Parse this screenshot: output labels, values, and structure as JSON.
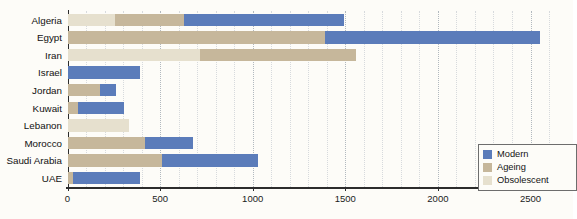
{
  "chart_data": {
    "type": "bar",
    "orientation": "horizontal",
    "stacked": true,
    "title": "",
    "subtitle": "",
    "xlabel": "",
    "ylabel": "",
    "xlim": [
      0,
      2600
    ],
    "xticks": [
      0,
      500,
      1000,
      1500,
      2000,
      2500
    ],
    "xticklabels": [
      "0",
      "500",
      "1000",
      "1500",
      "2000",
      "2500"
    ],
    "grid": true,
    "grid_axis": "x",
    "legend_position": "bottom-right",
    "categories": [
      "Algeria",
      "Egypt",
      "Iran",
      "Israel",
      "Jordan",
      "Kuwait",
      "Lebanon",
      "Morocco",
      "Saudi Arabia",
      "UAE"
    ],
    "series": [
      {
        "name": "Modern",
        "color": "#5b7cba",
        "values": [
          865,
          1160,
          0,
          390,
          85,
          250,
          0,
          255,
          520,
          360
        ]
      },
      {
        "name": "Ageing",
        "color": "#c6b79b",
        "values": [
          375,
          1390,
          845,
          0,
          175,
          55,
          0,
          420,
          510,
          30
        ]
      },
      {
        "name": "Obsolescent",
        "color": "#e6e0ce",
        "values": [
          255,
          0,
          715,
          0,
          0,
          0,
          330,
          0,
          0,
          0
        ]
      }
    ],
    "stack_order": [
      "Obsolescent",
      "Ageing",
      "Modern"
    ],
    "totals": [
      1495,
      2550,
      1560,
      390,
      260,
      305,
      330,
      675,
      1030,
      390
    ]
  },
  "legend": {
    "entries": [
      {
        "label": "Modern",
        "color": "#5b7cba"
      },
      {
        "label": "Ageing",
        "color": "#c6b79b"
      },
      {
        "label": "Obsolescent",
        "color": "#e6e0ce"
      }
    ]
  }
}
